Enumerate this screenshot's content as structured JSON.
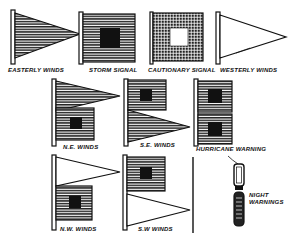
{
  "figure": {
    "ink_color": "#111111",
    "paper_color": "#ffffff",
    "signals": [
      {
        "id": "easterly",
        "label": "Easterly Winds",
        "shape": "pennant-striped"
      },
      {
        "id": "storm",
        "label": "Storm Signal",
        "shape": "square-striped-black-center"
      },
      {
        "id": "cautionary",
        "label": "Cautionary Signal",
        "shape": "square-checked-white-center"
      },
      {
        "id": "westerly",
        "label": "Westerly Winds",
        "shape": "pennant-white"
      },
      {
        "id": "ne",
        "label": "N.E. Winds",
        "shape": "pennant-striped-over-square"
      },
      {
        "id": "se",
        "label": "S.E. Winds",
        "shape": "square-over-pennant-striped"
      },
      {
        "id": "hurricane",
        "label": "Hurricane Warning",
        "shape": "two-squares-striped"
      },
      {
        "id": "nw",
        "label": "N.W. Winds",
        "shape": "pennant-white-over-square"
      },
      {
        "id": "sw",
        "label": "S.W Winds",
        "shape": "square-over-pennant-white"
      },
      {
        "id": "night",
        "label_line1": "Night",
        "label_line2": "Warnings",
        "shape": "lanterns"
      }
    ]
  }
}
